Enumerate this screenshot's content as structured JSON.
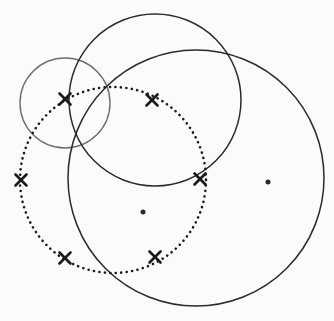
{
  "figure": {
    "width": 334,
    "height": 321,
    "background_color": "#fbfbfa"
  },
  "colors": {
    "stroke_dark": "#2b2b2f",
    "stroke_gray": "#6f6f72",
    "stroke_dotted": "#1d1d1f",
    "marker_cross": "#1a1a1c",
    "marker_dot": "#2a2a2d",
    "background": "#fbfbfa"
  },
  "chart_data": {
    "type": "scatter",
    "xlabel": "",
    "ylabel": "",
    "xlim": [
      0,
      334
    ],
    "ylim": [
      0,
      321
    ],
    "grid": false,
    "legend": "none",
    "circles": [
      {
        "name": "small-gray-circle",
        "cx": 65,
        "cy": 103,
        "r": 45,
        "style": "solid",
        "color": "#6f6f72",
        "stroke_width": 1.4
      },
      {
        "name": "upper-dark-circle",
        "cx": 155,
        "cy": 100,
        "r": 86,
        "style": "solid",
        "color": "#2b2b2f",
        "stroke_width": 1.5
      },
      {
        "name": "large-right-circle",
        "cx": 196,
        "cy": 178,
        "r": 128,
        "style": "solid",
        "color": "#2b2b2f",
        "stroke_width": 1.5
      },
      {
        "name": "dotted-circle",
        "cx": 113,
        "cy": 180,
        "r": 93,
        "style": "dotted",
        "color": "#1d1d1f",
        "stroke_width": 2.6
      }
    ],
    "cross_markers": [
      {
        "label": "x1",
        "x": 65,
        "y": 99,
        "size": 11
      },
      {
        "label": "x2",
        "x": 152,
        "y": 100,
        "size": 11
      },
      {
        "label": "x3",
        "x": 21,
        "y": 180,
        "size": 11
      },
      {
        "label": "x4",
        "x": 200,
        "y": 179,
        "size": 11
      },
      {
        "label": "x5",
        "x": 65,
        "y": 258,
        "size": 11
      },
      {
        "label": "x6",
        "x": 155,
        "y": 257,
        "size": 11
      }
    ],
    "dot_markers": [
      {
        "label": "d1",
        "x": 143,
        "y": 212,
        "size": 5
      },
      {
        "label": "d2",
        "x": 268,
        "y": 182,
        "size": 5
      }
    ]
  }
}
